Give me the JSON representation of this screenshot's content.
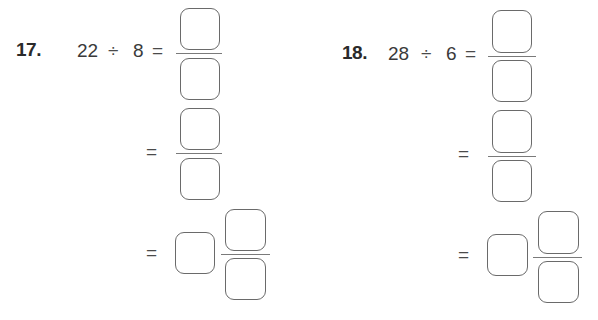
{
  "problems": [
    {
      "number": "17.",
      "dividend": "22",
      "divide_sign": "÷",
      "divisor": "8",
      "equals": "=",
      "steps": [
        {
          "type": "fraction",
          "equals": "=",
          "numerator": "",
          "denominator": ""
        },
        {
          "type": "fraction",
          "equals": "=",
          "numerator": "",
          "denominator": ""
        },
        {
          "type": "mixed-number",
          "equals": "=",
          "whole": "",
          "numerator": "",
          "denominator": ""
        }
      ]
    },
    {
      "number": "18.",
      "dividend": "28",
      "divide_sign": "÷",
      "divisor": "6",
      "equals": "=",
      "steps": [
        {
          "type": "fraction",
          "equals": "=",
          "numerator": "",
          "denominator": ""
        },
        {
          "type": "fraction",
          "equals": "=",
          "numerator": "",
          "denominator": ""
        },
        {
          "type": "mixed-number",
          "equals": "=",
          "whole": "",
          "numerator": "",
          "denominator": ""
        }
      ]
    }
  ]
}
